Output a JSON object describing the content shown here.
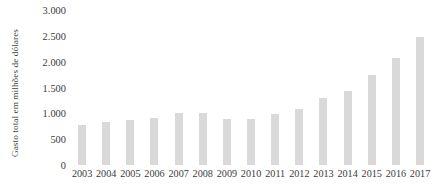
{
  "chart_data": {
    "type": "bar",
    "title": "",
    "subtitle": "",
    "xlabel": "",
    "ylabel": "Gasto total em milhões de dólares",
    "categories": [
      "2003",
      "2004",
      "2005",
      "2006",
      "2007",
      "2008",
      "2009",
      "2010",
      "2011",
      "2012",
      "2013",
      "2014",
      "2015",
      "2016",
      "2017"
    ],
    "values": [
      780,
      840,
      880,
      915,
      1015,
      1000,
      890,
      900,
      995,
      1080,
      1300,
      1440,
      1750,
      2070,
      2480
    ],
    "ylim": [
      0,
      3000
    ],
    "ytick_values": [
      0,
      500,
      1000,
      1500,
      2000,
      2500,
      3000
    ],
    "ytick_labels": [
      "0",
      "500",
      "1.000",
      "1.500",
      "2.000",
      "2.500",
      "3.000"
    ],
    "grid": false,
    "legend": null,
    "bar_color": "#d9d9d9",
    "text_color": "#3a3a3a",
    "background_color": "#ffffff"
  }
}
